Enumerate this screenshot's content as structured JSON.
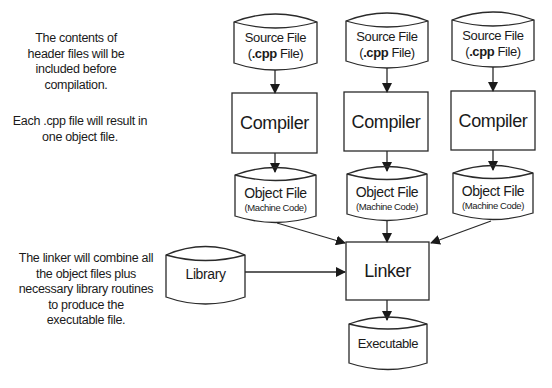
{
  "notes": {
    "header": "The contents of header files will be included before compilation.",
    "compile": "Each .cpp file will result in one object file.",
    "linker": "The linker will combine all the object files plus necessary library routines to produce the executable file."
  },
  "source_files": [
    {
      "line1": "Source File",
      "line2_prefix": "(",
      "line2_bold": ".cpp",
      "line2_suffix": " File)"
    },
    {
      "line1": "Source File",
      "line2_prefix": "(",
      "line2_bold": ".cpp",
      "line2_suffix": " File)"
    },
    {
      "line1": "Source File",
      "line2_prefix": "(",
      "line2_bold": ".cpp",
      "line2_suffix": " File)"
    }
  ],
  "compilers": [
    {
      "label": "Compiler"
    },
    {
      "label": "Compiler"
    },
    {
      "label": "Compiler"
    }
  ],
  "object_files": [
    {
      "line1": "Object File",
      "line2": "(Machine Code)"
    },
    {
      "line1": "Object File",
      "line2": "(Machine Code)"
    },
    {
      "line1": "Object File",
      "line2": "(Machine Code)"
    }
  ],
  "library": {
    "label": "Library"
  },
  "linker": {
    "label": "Linker"
  },
  "executable": {
    "label": "Executable"
  },
  "colors": {
    "stroke": "#2a2a2a",
    "text": "#1a1a1a",
    "background": "#ffffff"
  }
}
